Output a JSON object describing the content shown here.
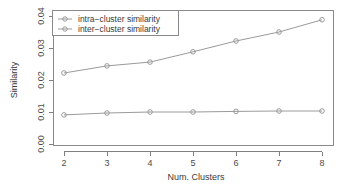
{
  "chart_data": {
    "type": "line",
    "title": "",
    "xlabel": "Num. Clusters",
    "ylabel": "Similarity",
    "x": [
      2,
      3,
      4,
      5,
      6,
      7,
      8
    ],
    "xtick_labels": [
      "2",
      "3",
      "4",
      "5",
      "6",
      "7",
      "8"
    ],
    "ytick_labels": [
      "0.00",
      "0.01",
      "0.02",
      "0.03",
      "0.04"
    ],
    "ytick_values": [
      0.0,
      0.01,
      0.02,
      0.03,
      0.04
    ],
    "xlim": [
      1.7,
      8.3
    ],
    "ylim": [
      0.0,
      0.04
    ],
    "grid": false,
    "legend_position": "top-left",
    "series": [
      {
        "name": "intra-cluster similarity",
        "label": "intra−cluster similarity",
        "color": "#9a9a9a",
        "marker": "circle",
        "values": [
          0.0091,
          0.0097,
          0.01,
          0.01,
          0.0102,
          0.0103,
          0.0103
        ]
      },
      {
        "name": "inter-cluster similarity",
        "label": "inter−cluster similarity",
        "color": "#9a9a9a",
        "marker": "circle",
        "values": [
          0.0222,
          0.0244,
          0.0256,
          0.0288,
          0.0322,
          0.035,
          0.0388
        ]
      }
    ]
  },
  "colors": {
    "background": "#ffffff",
    "axis": "#808080",
    "text": "#3a3a3a",
    "series": "#9a9a9a"
  }
}
